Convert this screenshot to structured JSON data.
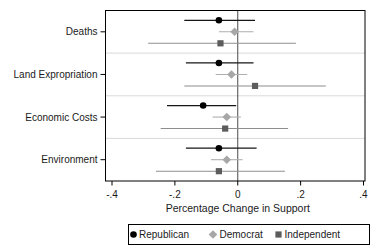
{
  "chart_data": {
    "type": "scatter",
    "subtype": "coefficient-dot-whisker",
    "title": "",
    "xlabel": "Percentage Change in Support",
    "ylabel": "",
    "xlim": [
      -0.4,
      0.4
    ],
    "grid": "horizontal-group-separators",
    "zero_reference_line": true,
    "legend_position": "bottom",
    "categories": [
      "Deaths",
      "Land Expropriation",
      "Economic Costs",
      "Environment"
    ],
    "x_ticks": [
      {
        "value": -0.4,
        "label": "-.4"
      },
      {
        "value": -0.2,
        "label": "-.2"
      },
      {
        "value": 0,
        "label": "0"
      },
      {
        "value": 0.2,
        "label": ".2"
      },
      {
        "value": 0.4,
        "label": ".4"
      }
    ],
    "series": [
      {
        "name": "Republican",
        "marker": "circle",
        "marker_color": "#000000",
        "line_color": "#161616",
        "points": [
          {
            "category": "Deaths",
            "value": -0.06,
            "ci_low": -0.17,
            "ci_high": 0.055
          },
          {
            "category": "Land Expropriation",
            "value": -0.06,
            "ci_low": -0.165,
            "ci_high": 0.05
          },
          {
            "category": "Economic Costs",
            "value": -0.11,
            "ci_low": -0.225,
            "ci_high": -0.005
          },
          {
            "category": "Environment",
            "value": -0.06,
            "ci_low": -0.165,
            "ci_high": 0.06
          }
        ]
      },
      {
        "name": "Democrat",
        "marker": "diamond",
        "marker_color": "#a7a7a7",
        "line_color": "#aeaeae",
        "points": [
          {
            "category": "Deaths",
            "value": -0.01,
            "ci_low": -0.06,
            "ci_high": 0.05
          },
          {
            "category": "Land Expropriation",
            "value": -0.02,
            "ci_low": -0.07,
            "ci_high": 0.03
          },
          {
            "category": "Economic Costs",
            "value": -0.035,
            "ci_low": -0.08,
            "ci_high": 0.01
          },
          {
            "category": "Environment",
            "value": -0.035,
            "ci_low": -0.085,
            "ci_high": 0.015
          }
        ]
      },
      {
        "name": "Independent",
        "marker": "square",
        "marker_color": "#5c5c5c",
        "line_color": "#8e8e8e",
        "points": [
          {
            "category": "Deaths",
            "value": -0.055,
            "ci_low": -0.285,
            "ci_high": 0.185
          },
          {
            "category": "Land Expropriation",
            "value": 0.055,
            "ci_low": -0.17,
            "ci_high": 0.28
          },
          {
            "category": "Economic Costs",
            "value": -0.04,
            "ci_low": -0.245,
            "ci_high": 0.16
          },
          {
            "category": "Environment",
            "value": -0.06,
            "ci_low": -0.26,
            "ci_high": 0.15
          }
        ]
      }
    ],
    "colors": {
      "frame": "#000000",
      "zero_line": "#4a4a4a",
      "separator_grid": "#d9d9d9",
      "background": "#ffffff"
    }
  }
}
